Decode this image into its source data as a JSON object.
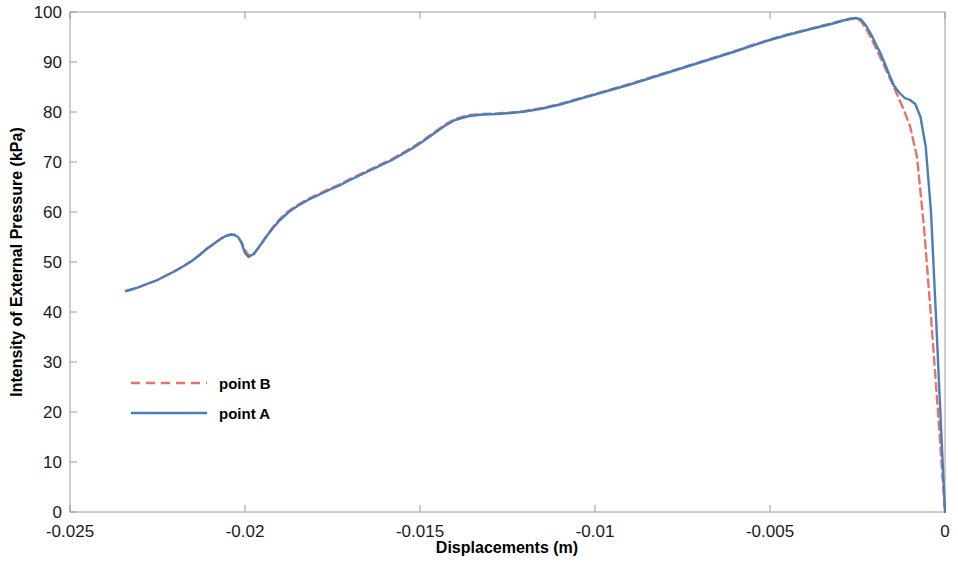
{
  "chart_data": {
    "type": "line",
    "title": "",
    "xlabel": "Displacements (m)",
    "ylabel": "Intensity of External Pressure (kPa)",
    "xlim": [
      -0.025,
      0
    ],
    "ylim": [
      0,
      100
    ],
    "grid": false,
    "legend_position": "center-left",
    "xticks": [
      -0.025,
      -0.02,
      -0.015,
      -0.01,
      -0.005,
      0
    ],
    "xtick_labels": [
      "-0.025",
      "-0.02",
      "-0.015",
      "-0.01",
      "-0.005",
      "0"
    ],
    "yticks": [
      0,
      10,
      20,
      30,
      40,
      50,
      60,
      70,
      80,
      90,
      100
    ],
    "ytick_labels": [
      "0",
      "10",
      "20",
      "30",
      "40",
      "50",
      "60",
      "70",
      "80",
      "90",
      "100"
    ],
    "series": [
      {
        "name": "point B",
        "color": "#E8736A",
        "style": "dashed",
        "width": 2.4,
        "x": [
          -0.0234,
          -0.0231,
          -0.0228,
          -0.0225,
          -0.02225,
          -0.022,
          -0.02175,
          -0.0215,
          -0.0213,
          -0.0211,
          -0.0209,
          -0.0207,
          -0.02055,
          -0.0204,
          -0.0203,
          -0.0202,
          -0.0201,
          -0.02,
          -0.0199,
          -0.01975,
          -0.0196,
          -0.0194,
          -0.0192,
          -0.019,
          -0.01875,
          -0.0185,
          -0.0182,
          -0.0179,
          -0.0176,
          -0.0173,
          -0.017,
          -0.0167,
          -0.0164,
          -0.0161,
          -0.0158,
          -0.0155,
          -0.0152,
          -0.0149,
          -0.0146,
          -0.0143,
          -0.014,
          -0.0136,
          -0.0132,
          -0.0128,
          -0.0124,
          -0.012,
          -0.0115,
          -0.011,
          -0.0105,
          -0.01,
          -0.0095,
          -0.009,
          -0.0085,
          -0.008,
          -0.0075,
          -0.007,
          -0.0065,
          -0.006,
          -0.0055,
          -0.005,
          -0.0045,
          -0.004,
          -0.0036,
          -0.0032,
          -0.0029,
          -0.0027,
          -0.00254,
          -0.0024,
          -0.00225,
          -0.0021,
          -0.00195,
          -0.0018,
          -0.00165,
          -0.0015,
          -0.00135,
          -0.0012,
          -0.001,
          -0.0008,
          -0.0006,
          -0.0004,
          -0.0002,
          0.0
        ],
        "y": [
          44.2,
          44.8,
          45.6,
          46.4,
          47.3,
          48.2,
          49.2,
          50.3,
          51.4,
          52.6,
          53.6,
          54.6,
          55.2,
          55.5,
          55.4,
          55.0,
          54.0,
          52.4,
          51.3,
          51.6,
          53.0,
          55.0,
          57.0,
          58.6,
          60.2,
          61.4,
          62.6,
          63.6,
          64.6,
          65.5,
          66.6,
          67.6,
          68.6,
          69.6,
          70.6,
          71.8,
          73.0,
          74.4,
          75.9,
          77.4,
          78.6,
          79.4,
          79.6,
          79.7,
          79.9,
          80.2,
          80.8,
          81.6,
          82.6,
          83.6,
          84.6,
          85.6,
          86.7,
          87.8,
          88.9,
          90.0,
          91.1,
          92.2,
          93.4,
          94.5,
          95.5,
          96.4,
          97.1,
          97.8,
          98.4,
          98.7,
          98.8,
          98.2,
          96.6,
          94.6,
          92.4,
          90.2,
          87.9,
          85.6,
          83.2,
          80.8,
          77.2,
          71.0,
          57.0,
          39.0,
          20.0,
          0.0
        ]
      },
      {
        "name": "point A",
        "color": "#4A7EBB",
        "style": "solid",
        "width": 2.4,
        "x": [
          -0.0234,
          -0.0231,
          -0.0228,
          -0.0225,
          -0.02225,
          -0.022,
          -0.02175,
          -0.0215,
          -0.0213,
          -0.0211,
          -0.0209,
          -0.0207,
          -0.02055,
          -0.0204,
          -0.0203,
          -0.0202,
          -0.0201,
          -0.02,
          -0.0199,
          -0.01975,
          -0.0196,
          -0.0194,
          -0.0192,
          -0.019,
          -0.01875,
          -0.0185,
          -0.0182,
          -0.0179,
          -0.0176,
          -0.0173,
          -0.017,
          -0.0167,
          -0.0164,
          -0.0161,
          -0.0158,
          -0.0155,
          -0.0152,
          -0.0149,
          -0.0146,
          -0.0143,
          -0.014,
          -0.0136,
          -0.0132,
          -0.0128,
          -0.0124,
          -0.012,
          -0.0115,
          -0.011,
          -0.0105,
          -0.01,
          -0.0095,
          -0.009,
          -0.0085,
          -0.008,
          -0.0075,
          -0.007,
          -0.0065,
          -0.006,
          -0.0055,
          -0.005,
          -0.0045,
          -0.004,
          -0.0036,
          -0.0032,
          -0.0029,
          -0.0027,
          -0.00254,
          -0.0024,
          -0.00225,
          -0.0021,
          -0.00195,
          -0.00186,
          -0.00175,
          -0.0016,
          -0.00145,
          -0.0013,
          -0.00115,
          -0.001,
          -0.00085,
          -0.0007,
          -0.00055,
          -0.0004,
          -0.00025,
          -0.00012,
          0.0
        ],
        "y": [
          44.2,
          44.8,
          45.6,
          46.4,
          47.3,
          48.2,
          49.2,
          50.3,
          51.4,
          52.6,
          53.6,
          54.6,
          55.2,
          55.5,
          55.4,
          55.0,
          53.8,
          51.8,
          51.0,
          51.6,
          53.0,
          55.0,
          56.8,
          58.4,
          60.0,
          61.2,
          62.4,
          63.4,
          64.4,
          65.3,
          66.4,
          67.4,
          68.4,
          69.4,
          70.4,
          71.6,
          72.8,
          74.2,
          75.7,
          77.2,
          78.4,
          79.2,
          79.5,
          79.6,
          79.8,
          80.1,
          80.7,
          81.5,
          82.5,
          83.5,
          84.5,
          85.5,
          86.6,
          87.7,
          88.8,
          89.9,
          91.0,
          92.1,
          93.3,
          94.4,
          95.4,
          96.3,
          97.0,
          97.7,
          98.3,
          98.6,
          98.8,
          98.5,
          97.2,
          95.4,
          93.2,
          92.0,
          90.2,
          87.6,
          85.2,
          83.8,
          82.8,
          82.4,
          81.6,
          79.0,
          73.0,
          60.0,
          38.0,
          18.0,
          0.0
        ]
      }
    ]
  },
  "legend": {
    "entries": [
      {
        "label": "point B"
      },
      {
        "label": "point A"
      }
    ]
  },
  "axes": {
    "x_title": "Displacements (m)",
    "y_title": "Intensity of External Pressure (kPa)"
  }
}
